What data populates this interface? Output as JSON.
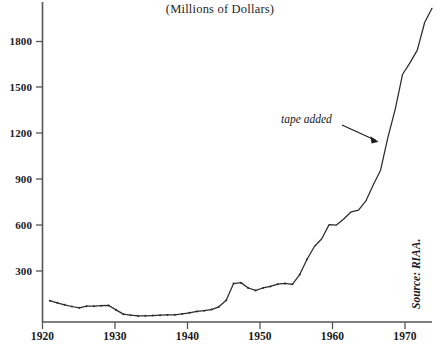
{
  "chart_data": {
    "type": "line",
    "title": "(Millions of Dollars)",
    "subtitle": "",
    "xlabel": "",
    "ylabel": "",
    "xlim": [
      1920,
      1973
    ],
    "ylim": [
      0,
      2000
    ],
    "grid": false,
    "legend": null,
    "xticks": [
      1920,
      1930,
      1940,
      1950,
      1960,
      1970
    ],
    "xtick_labels": [
      "1920",
      "1930",
      "1940",
      "1950",
      "1960",
      "1970"
    ],
    "yticks": [
      300,
      600,
      900,
      1200,
      1500,
      1800
    ],
    "ytick_labels": [
      "300",
      "600",
      "900",
      "1200",
      "1500",
      "1800"
    ],
    "line_color": "#2b2b2b",
    "series": [
      {
        "name": "Record sales",
        "x": [
          1921,
          1922,
          1923,
          1924,
          1925,
          1926,
          1927,
          1928,
          1929,
          1930,
          1931,
          1932,
          1933,
          1934,
          1935,
          1936,
          1937,
          1938,
          1939,
          1940,
          1941,
          1942,
          1943,
          1944,
          1945,
          1946,
          1947,
          1948,
          1949,
          1950,
          1951,
          1952,
          1953,
          1954,
          1955,
          1956,
          1957,
          1958,
          1959,
          1960,
          1961,
          1962,
          1963,
          1964,
          1965,
          1966,
          1967,
          1968,
          1969,
          1970,
          1971,
          1972,
          1973
        ],
        "values": [
          106,
          92,
          79,
          68,
          59,
          70,
          70,
          73,
          75,
          46,
          18,
          11,
          6,
          7,
          9,
          11,
          13,
          14,
          19,
          27,
          36,
          41,
          48,
          66,
          109,
          218,
          224,
          189,
          173,
          189,
          199,
          214,
          219,
          213,
          277,
          377,
          460,
          511,
          603,
          600,
          640,
          687,
          698,
          758,
          862,
          959,
          1173,
          1358,
          1586,
          1660,
          1744,
          1924,
          2017
        ]
      }
    ],
    "annotations": [
      {
        "name": "tape-added",
        "text": "tape added",
        "text_x": 1966.2,
        "text_y": 1290,
        "point_x": 1967,
        "point_y": 1160
      },
      {
        "name": "source",
        "text": "Source: RIAA."
      }
    ]
  }
}
